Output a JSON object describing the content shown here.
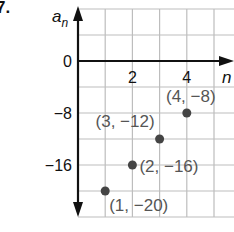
{
  "problem": {
    "number": "7."
  },
  "chart_data": {
    "type": "scatter",
    "title": "",
    "xlabel": "n",
    "ylabel": "a_n",
    "ylabel_main": "a",
    "ylabel_sub": "n",
    "xlim": [
      0,
      5.5
    ],
    "ylim": [
      -24,
      8
    ],
    "grid": true,
    "x_grid_step": 1,
    "y_grid_step": 4,
    "x_ticks": [
      {
        "value": 2,
        "label": "2"
      },
      {
        "value": 4,
        "label": "4"
      }
    ],
    "y_ticks": [
      {
        "value": 0,
        "label": "0"
      },
      {
        "value": -8,
        "label": "−8"
      },
      {
        "value": -16,
        "label": "−16"
      }
    ],
    "points": [
      {
        "x": 1,
        "y": -20,
        "label": "(1, −20)"
      },
      {
        "x": 2,
        "y": -16,
        "label": "(2, −16)"
      },
      {
        "x": 3,
        "y": -12,
        "label": "(3, −12)"
      },
      {
        "x": 4,
        "y": -8,
        "label": "(4, −8)"
      }
    ],
    "colors": {
      "axis": "#111111",
      "grid": "#bdbdbd",
      "point": "#444444",
      "point_label": "#555555"
    }
  }
}
